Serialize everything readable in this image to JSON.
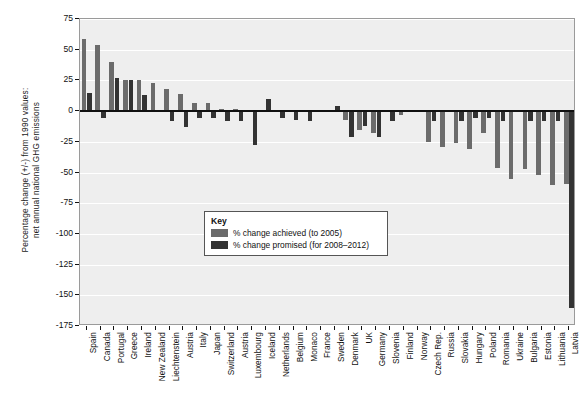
{
  "chart_data": {
    "type": "bar",
    "title": "",
    "subtitle": "",
    "xlabel": "",
    "ylabel": "Percentage change (+/-) from 1990 values:\nnet annual national GHG emissions",
    "ylabel_line1": "Percentage change (+/-) from 1990 values:",
    "ylabel_line2": "net annual national GHG emissions",
    "ylim": [
      -175,
      75
    ],
    "yticks": [
      75,
      50,
      25,
      0,
      -25,
      -50,
      -75,
      -100,
      -125,
      -150,
      -175
    ],
    "ytick_labels": [
      "75",
      "50",
      "25",
      "0",
      "-25",
      "-50",
      "-75",
      "-100",
      "-125",
      "-150",
      "-175"
    ],
    "grid": true,
    "grid_orientation": "horizontal",
    "legend_position": "inside-center",
    "legend_title": "Key",
    "plot_background": "#eeeeee",
    "gridline_color": "#ffffff",
    "categories": [
      "Spain",
      "Canada",
      "Portugal",
      "Greece",
      "Ireland",
      "New Zealand",
      "Liechtenstein",
      "Austria",
      "Italy",
      "Japan",
      "Switzerland",
      "Austria",
      "Luxembourg",
      "Iceland",
      "Netherlands",
      "Belgium",
      "Monaco",
      "France",
      "Sweden",
      "Denmark",
      "UK",
      "Germany",
      "Slovenia",
      "Finland",
      "Norway",
      "Czech Rep.",
      "Russia",
      "Slovakia",
      "Hungary",
      "Poland",
      "Romania",
      "Ukraine",
      "Bulgaria",
      "Estonia",
      "Lithuania",
      "Latvia"
    ],
    "series": [
      {
        "name": "% change achieved (to 2005)",
        "color": "#6b6b6b",
        "values": [
          59,
          54,
          40,
          25,
          25,
          23,
          18,
          14,
          7,
          7,
          2,
          2,
          0.5,
          1,
          0,
          -1,
          -1,
          -1,
          -1,
          -7,
          -15,
          -18,
          -1,
          -3,
          -1,
          -25,
          -29,
          -26,
          -31,
          -18,
          -46,
          -55,
          -47,
          -52,
          -60,
          -59
        ]
      },
      {
        "name": "% change promised (for 2008–2012)",
        "color": "#333333",
        "values": [
          15,
          -6,
          27,
          25,
          13,
          0,
          -8,
          -13,
          -6,
          -6,
          -8,
          -8,
          -28,
          10,
          -6,
          -7,
          -8,
          0,
          4,
          -21,
          -12,
          -21,
          -8,
          0,
          1,
          -8,
          0,
          -8,
          -6,
          -6,
          -8,
          0,
          -8,
          -8,
          -8,
          -160
        ]
      }
    ]
  },
  "legend": {
    "title": "Key",
    "entries": [
      {
        "label": "% change achieved (to 2005)",
        "color": "#6b6b6b"
      },
      {
        "label": "% change promised (for 2008–2012)",
        "color": "#333333"
      }
    ]
  }
}
